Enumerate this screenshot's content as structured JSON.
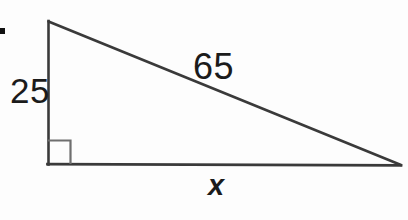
{
  "figure": {
    "type": "right-triangle-diagram",
    "background_color": "#fdfdfd",
    "stroke_color": "#3a3a3a",
    "text_color": "#1b1b1b",
    "canvas": {
      "width": 408,
      "height": 220
    },
    "bullet_marker": {
      "name": "list-bullet",
      "x": 0,
      "y": 28,
      "width": 5,
      "height": 6,
      "color": "#111111"
    },
    "vertices": {
      "apex": {
        "x": 48,
        "y": 21
      },
      "right_angle": {
        "x": 48,
        "y": 164
      },
      "far_right": {
        "x": 401,
        "y": 165
      }
    },
    "right_angle_marker": {
      "x": 48,
      "y": 140,
      "size": 23,
      "color": "#6f6f6f"
    },
    "labels": {
      "vertical_leg": "25",
      "hypotenuse": "65",
      "base": "x"
    }
  },
  "chart_data": {
    "type": "diagram",
    "title": "",
    "shape": "right triangle",
    "sides": [
      {
        "name": "vertical leg",
        "label": "25",
        "value": 25,
        "known": true
      },
      {
        "name": "hypotenuse",
        "label": "65",
        "value": 65,
        "known": true
      },
      {
        "name": "horizontal base",
        "label": "x",
        "value": null,
        "known": false
      }
    ],
    "right_angle_at": "bottom-left vertex",
    "annotations": [
      "25",
      "65",
      "x"
    ]
  }
}
